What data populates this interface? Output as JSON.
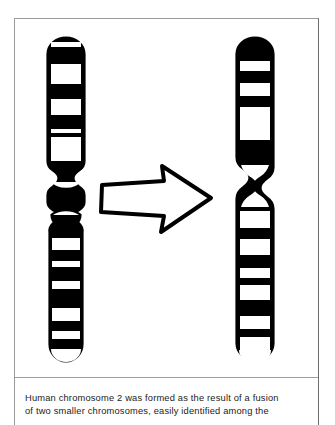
{
  "figure": {
    "kind": "chromosome-fusion-diagram",
    "ink_color": "#000000",
    "background_color": "#ffffff",
    "frame_color": "#9a9a9a",
    "left_group": {
      "label": "two smaller ancestral chromosomes",
      "upper_chromosome": {
        "name": "upper-left-chromosome",
        "band_pattern": "alternating dark and light bands with short lower arm"
      },
      "lower_chromosome": {
        "name": "lower-left-chromosome",
        "band_pattern": "small pale short arm above a long banded arm"
      }
    },
    "arrow": {
      "name": "fusion-arrow",
      "direction": "right",
      "style": "hand-drawn outline block arrow"
    },
    "right_group": {
      "label": "fused human chromosome 2",
      "chromosome": {
        "name": "human-chromosome-2",
        "band_pattern": "long banded upper arm, centromere constriction, long banded lower arm"
      }
    }
  },
  "caption": {
    "lines": [
      "Human chromosome 2 was formed as the result of a fusion",
      "of two smaller chromosomes, easily identified among the"
    ]
  }
}
